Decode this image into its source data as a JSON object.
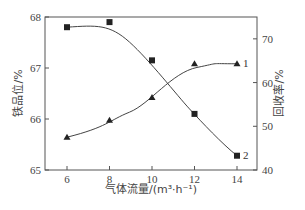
{
  "chart_data": {
    "type": "line",
    "title": "",
    "xlabel": "气体流量/(m³·h⁻¹)",
    "ylabel": "铁品位/%",
    "ylabel_right": "回收率/%",
    "x": [
      6,
      8,
      10,
      12,
      14
    ],
    "xlim": [
      5,
      15
    ],
    "ylim": [
      65,
      68
    ],
    "ylim_right": [
      40,
      75
    ],
    "xticks": [
      6,
      8,
      10,
      12,
      14
    ],
    "yticks": [
      65,
      66,
      67,
      68
    ],
    "yticks_right": [
      40,
      50,
      60,
      70
    ],
    "grid": false,
    "legend": "inline labels at line ends",
    "series": [
      {
        "name": "1",
        "label": "1",
        "marker": "triangle",
        "axis": "right",
        "quantity": "回收率/%",
        "values": [
          47.5,
          51.4,
          56.6,
          64.3,
          64.3
        ]
      },
      {
        "name": "2",
        "label": "2",
        "marker": "square",
        "axis": "left",
        "quantity": "铁品位/%",
        "values": [
          67.8,
          67.9,
          67.15,
          66.1,
          65.28
        ]
      }
    ]
  },
  "labels": {
    "xlabel": "气体流量/(m³·h⁻¹)",
    "ylabel_left": "铁品位/%",
    "ylabel_right": "回收率/%",
    "series1": "1",
    "series2": "2"
  }
}
